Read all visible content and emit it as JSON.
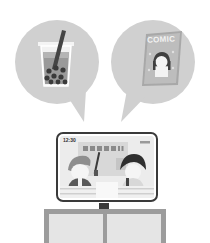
{
  "illustration": {
    "bubble_left": {
      "subject": "bubble-tea-icon"
    },
    "bubble_right": {
      "subject": "comic-book-icon",
      "comic_title": "COMIC"
    },
    "tv": {
      "clock": "12:30",
      "banner_exclaim": "!!",
      "subject": "news-broadcast"
    },
    "colors": {
      "bubble": "#cfcfcf",
      "dark": "#4a4a4a",
      "mid": "#8e8e8e",
      "light": "#ececec",
      "frame": "#3c3c3c",
      "stand": "#9a9a9a",
      "stand_panel": "#e4e4e4"
    }
  }
}
